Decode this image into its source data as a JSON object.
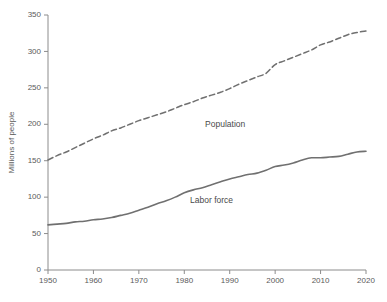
{
  "chart_data": {
    "type": "line",
    "title": "",
    "xlabel": "",
    "ylabel": "Millions of people",
    "xlim": [
      1950,
      2020
    ],
    "ylim": [
      0,
      350
    ],
    "ytick_step": 50,
    "xtick_step": 10,
    "grid": false,
    "legend_position": "inline-annotation",
    "background_color": "#ffffff",
    "line_color": "#707070",
    "text_color": "#4a4a4a",
    "axis_color": "#8c8c8c",
    "xticks": [
      "1950",
      "1960",
      "1970",
      "1980",
      "1990",
      "2000",
      "2010",
      "2020"
    ],
    "yticks": [
      "0",
      "50",
      "100",
      "150",
      "200",
      "250",
      "300",
      "350"
    ],
    "x": [
      1950,
      1952,
      1954,
      1956,
      1958,
      1960,
      1962,
      1964,
      1966,
      1968,
      1970,
      1972,
      1974,
      1976,
      1978,
      1980,
      1982,
      1984,
      1986,
      1988,
      1990,
      1992,
      1994,
      1996,
      1998,
      2000,
      2002,
      2004,
      2006,
      2008,
      2010,
      2012,
      2014,
      2016,
      2018,
      2020
    ],
    "series": [
      {
        "name": "Population",
        "style": "dashed",
        "label_x": 1989,
        "label_y": 196,
        "values": [
          151,
          157,
          162,
          168,
          174,
          180,
          185,
          191,
          195,
          200,
          205,
          209,
          213,
          217,
          222,
          227,
          231,
          236,
          240,
          244,
          249,
          255,
          260,
          265,
          270,
          282,
          287,
          292,
          297,
          302,
          309,
          313,
          318,
          323,
          326,
          328
        ]
      },
      {
        "name": "Labor force",
        "style": "solid",
        "label_x": 1986,
        "label_y": 92,
        "values": [
          62,
          63,
          64,
          66,
          67,
          69,
          70,
          72,
          75,
          78,
          82,
          86,
          91,
          95,
          100,
          106,
          110,
          113,
          117,
          121,
          125,
          128,
          131,
          133,
          137,
          142,
          144,
          147,
          151,
          154,
          154,
          155,
          156,
          159,
          162,
          163
        ]
      }
    ]
  }
}
